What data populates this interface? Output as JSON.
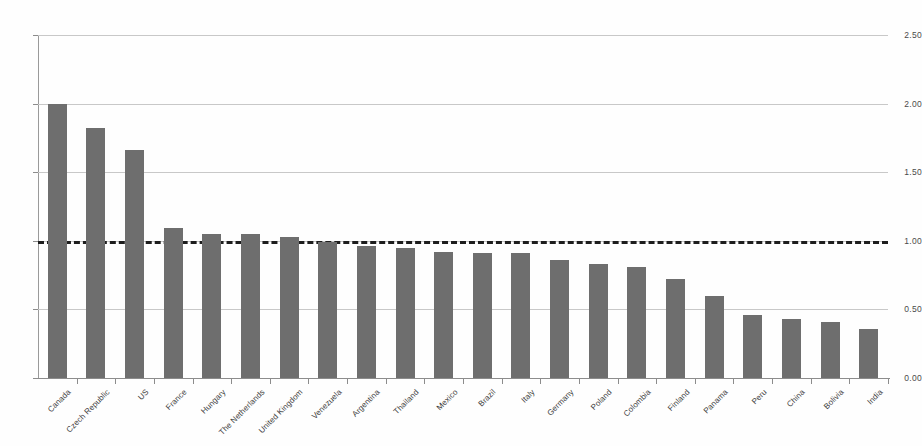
{
  "chart_data": {
    "type": "bar",
    "title": "",
    "subtitle": "",
    "xlabel": "",
    "ylabel": "",
    "ylim": [
      0.0,
      2.5
    ],
    "ytick_labels": [
      "0.00",
      "0.50",
      "1.00",
      "1.50",
      "2.00",
      "2.50"
    ],
    "ytick_values": [
      0.0,
      0.5,
      1.0,
      1.5,
      2.0,
      2.5
    ],
    "grid": true,
    "legend": "none",
    "bar_color": "#6e6e6e",
    "gridline_color": "#c8c8c8",
    "axis_color": "#8c8c8c",
    "reference_line": {
      "value": 1.0,
      "style": "dashed",
      "color": "#1d1d1d"
    },
    "categories": [
      "Canada",
      "Czech Republic",
      "US",
      "France",
      "Hungary",
      "The Netherlands",
      "United Kingdom",
      "Venezuela",
      "Argentina",
      "Thailand",
      "Mexico",
      "Brazil",
      "Italy",
      "Germany",
      "Poland",
      "Colombia",
      "Finland",
      "Panama",
      "Peru",
      "China",
      "Bolivia",
      "India"
    ],
    "values": [
      2.0,
      1.82,
      1.66,
      1.09,
      1.05,
      1.05,
      1.03,
      0.99,
      0.96,
      0.95,
      0.92,
      0.91,
      0.91,
      0.86,
      0.83,
      0.81,
      0.72,
      0.6,
      0.46,
      0.43,
      0.41,
      0.36
    ]
  }
}
